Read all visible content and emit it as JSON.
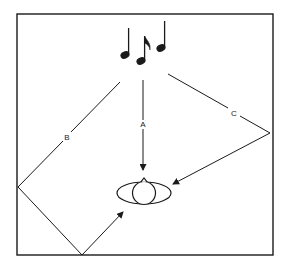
{
  "diagram": {
    "source": {
      "icon": "music-notes-icon",
      "notes": 3
    },
    "listener": {
      "icon": "head-top-view-icon"
    },
    "paths": [
      {
        "label": "A",
        "type": "direct"
      },
      {
        "label": "B",
        "type": "reflected-twice"
      },
      {
        "label": "C",
        "type": "reflected-once"
      }
    ],
    "colors": {
      "line": "#1a1a1a",
      "background": "#ffffff"
    }
  }
}
